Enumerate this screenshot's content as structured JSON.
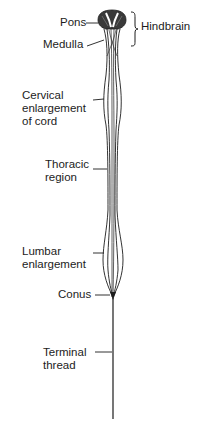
{
  "diagram": {
    "colors": {
      "ink": "#1c1c1c",
      "background": "#ffffff"
    },
    "labels": {
      "pons": "Pons",
      "medulla": "Medulla",
      "hindbrain": "Hindbrain",
      "cervical": "Cervical\nenlargement\nof cord",
      "thoracic": "Thoracic\nregion",
      "lumbar": "Lumbar\nenlargement",
      "conus": "Conus",
      "terminal": "Terminal\nthread"
    }
  }
}
